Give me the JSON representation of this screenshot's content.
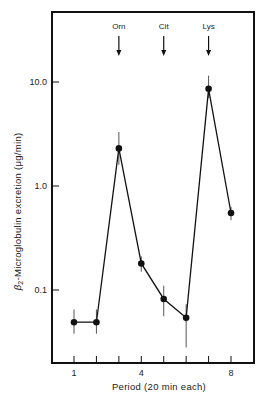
{
  "chart_data": {
    "type": "line",
    "title": "",
    "xlabel": "Period (20 min each)",
    "ylabel": "β2-Microglobulin excretion (μg/min)",
    "ylabel_prefix": "β",
    "ylabel_sub": "2",
    "ylabel_rest": "-Microglobulin excretion  (μg/min)",
    "yscale": "log",
    "ylim": [
      0.03,
      40
    ],
    "xlim": [
      0,
      9
    ],
    "x_ticks": [
      1,
      2,
      3,
      4,
      5,
      6,
      7,
      8
    ],
    "x_tick_labels": {
      "1": "1",
      "4": "4",
      "8": "8"
    },
    "y_ticks": [
      0.1,
      1.0,
      10.0
    ],
    "y_tick_labels": [
      "0.1",
      "1.0",
      "10.0"
    ],
    "grid": false,
    "legend": null,
    "series": [
      {
        "name": "β2-Microglobulin excretion",
        "x": [
          1,
          2,
          3,
          4,
          5,
          6,
          7,
          8
        ],
        "values": [
          0.049,
          0.049,
          2.3,
          0.18,
          0.082,
          0.054,
          8.6,
          0.55
        ],
        "error_low": [
          0.038,
          0.038,
          1.6,
          0.15,
          0.056,
          0.028,
          7.0,
          0.47
        ],
        "error_high": [
          0.065,
          0.065,
          3.3,
          0.21,
          0.11,
          0.073,
          11.5,
          0.63
        ]
      }
    ],
    "annotations": [
      {
        "label": "Orn",
        "x": 3,
        "type": "arrow-down"
      },
      {
        "label": "Cit",
        "x": 5,
        "type": "arrow-down"
      },
      {
        "label": "Lys",
        "x": 7,
        "type": "arrow-down"
      }
    ]
  }
}
